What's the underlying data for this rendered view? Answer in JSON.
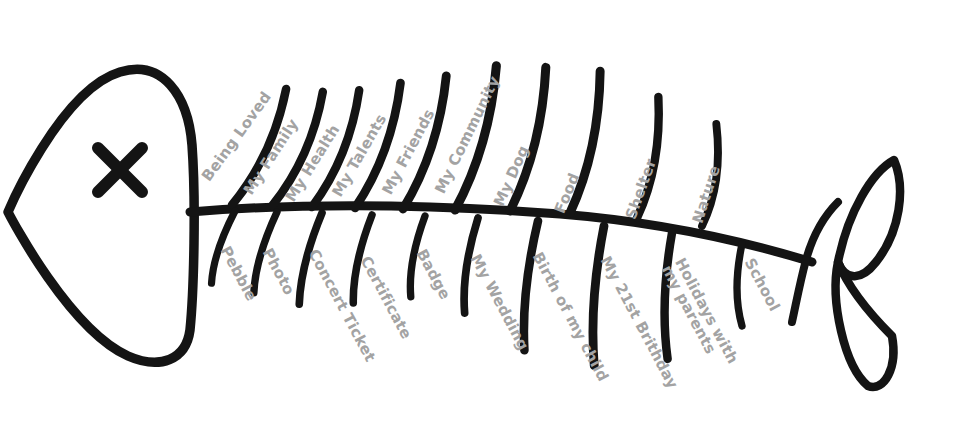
{
  "diagram": {
    "type": "fishbone-gratitude-diagram",
    "title": "",
    "background_color": "#ffffff",
    "bone_color": "#141414",
    "label_color": "#a3a3a3",
    "head": {
      "eye_icon": "x-eye-icon",
      "shape": "rounded-triangle"
    },
    "tail": {
      "shape": "double-leaf"
    },
    "top_bones": [
      {
        "label": "Being Loved",
        "x": 232,
        "y": 205,
        "angle": -65,
        "length": 128,
        "label_x": 206,
        "label_y": 172,
        "label_angle": -54
      },
      {
        "label": "My Family",
        "x": 272,
        "y": 206,
        "angle": -66,
        "length": 125,
        "label_x": 248,
        "label_y": 186,
        "label_angle": -57
      },
      {
        "label": "My Health",
        "x": 312,
        "y": 207,
        "angle": -68,
        "length": 126,
        "label_x": 290,
        "label_y": 193,
        "label_angle": -58
      },
      {
        "label": "My Talents",
        "x": 355,
        "y": 208,
        "angle": -70,
        "length": 133,
        "label_x": 337,
        "label_y": 188,
        "label_angle": -60
      },
      {
        "label": "My Friends",
        "x": 403,
        "y": 209,
        "angle": -72,
        "length": 140,
        "label_x": 387,
        "label_y": 186,
        "label_angle": -62
      },
      {
        "label": "My Community",
        "x": 455,
        "y": 210,
        "angle": -74,
        "length": 150,
        "label_x": 440,
        "label_y": 185,
        "label_angle": -64
      },
      {
        "label": "My Dog",
        "x": 510,
        "y": 211,
        "angle": -76,
        "length": 148,
        "label_x": 499,
        "label_y": 198,
        "label_angle": -66
      },
      {
        "label": "Food",
        "x": 570,
        "y": 213,
        "angle": -78,
        "length": 145,
        "label_x": 560,
        "label_y": 205,
        "label_angle": -68
      },
      {
        "label": "Shelter",
        "x": 637,
        "y": 218,
        "angle": -80,
        "length": 123,
        "label_x": 631,
        "label_y": 211,
        "label_angle": -70
      },
      {
        "label": "Nature",
        "x": 702,
        "y": 226,
        "angle": -82,
        "length": 103,
        "label_x": 698,
        "label_y": 215,
        "label_angle": -72
      }
    ],
    "bottom_bones": [
      {
        "label": "Pebble",
        "x": 235,
        "y": 211,
        "angle": 108,
        "length": 76,
        "label_x": 224,
        "label_y": 240,
        "label_angle": 62,
        "lines": 1
      },
      {
        "label": "Photo",
        "x": 277,
        "y": 212,
        "angle": 106,
        "length": 84,
        "label_x": 266,
        "label_y": 242,
        "label_angle": 62,
        "lines": 1
      },
      {
        "label": "Concert Ticket",
        "x": 322,
        "y": 213,
        "angle": 104,
        "length": 94,
        "label_x": 312,
        "label_y": 243,
        "label_angle": 62,
        "lines": 1
      },
      {
        "label": "Certificate",
        "x": 372,
        "y": 215,
        "angle": 102,
        "length": 90,
        "label_x": 364,
        "label_y": 250,
        "label_angle": 62,
        "lines": 1
      },
      {
        "label": "Badge",
        "x": 425,
        "y": 216,
        "angle": 100,
        "length": 82,
        "label_x": 420,
        "label_y": 243,
        "label_angle": 62,
        "lines": 1
      },
      {
        "label": "My Wedding",
        "x": 478,
        "y": 218,
        "angle": 98,
        "length": 96,
        "label_x": 474,
        "label_y": 248,
        "label_angle": 62,
        "lines": 1
      },
      {
        "label": "Birth of my child",
        "x": 538,
        "y": 221,
        "angle": 96,
        "length": 130,
        "label_x": 536,
        "label_y": 246,
        "label_angle": 62,
        "lines": 1
      },
      {
        "label": "My 21st Brithday",
        "x": 604,
        "y": 226,
        "angle": 94,
        "length": 140,
        "label_x": 604,
        "label_y": 250,
        "label_angle": 62,
        "lines": 1
      },
      {
        "label": "Holidays with my parents",
        "x": 672,
        "y": 233,
        "angle": 92,
        "length": 126,
        "label_x": 672,
        "label_y": 248,
        "label_angle": 62,
        "lines": 2
      },
      {
        "label": "School",
        "x": 742,
        "y": 244,
        "angle": 90,
        "length": 82,
        "label_x": 748,
        "label_y": 252,
        "label_angle": 62,
        "lines": 1
      }
    ]
  }
}
